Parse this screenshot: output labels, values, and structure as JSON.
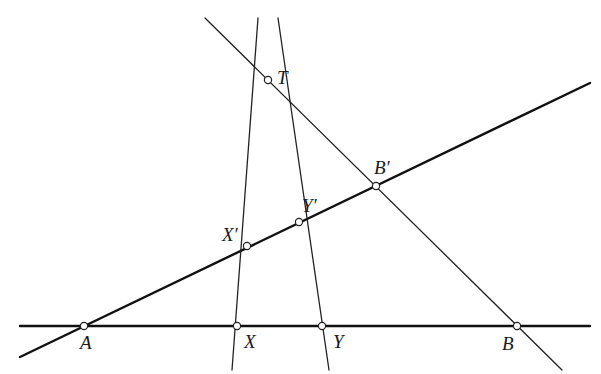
{
  "diagram": {
    "type": "projective-geometry-figure",
    "points": {
      "T": {
        "label": "T",
        "x": 268,
        "y": 80,
        "lx": 277,
        "ly": 84
      },
      "A": {
        "label": "A",
        "x": 84,
        "y": 326,
        "lx": 80,
        "ly": 349
      },
      "X": {
        "label": "X",
        "x": 237,
        "y": 326,
        "lx": 244,
        "ly": 348
      },
      "Y": {
        "label": "Y",
        "x": 322,
        "y": 326,
        "lx": 333,
        "ly": 348
      },
      "B": {
        "label": "B",
        "x": 517,
        "y": 326,
        "lx": 502,
        "ly": 350
      },
      "Xp": {
        "label": "X′",
        "x": 247,
        "y": 246,
        "lx": 222,
        "ly": 241
      },
      "Yp": {
        "label": "Y′",
        "x": 299,
        "y": 222,
        "lx": 302,
        "ly": 212
      },
      "Bp": {
        "label": "B′",
        "x": 376,
        "y": 186,
        "lx": 374,
        "ly": 174
      }
    },
    "lines": [
      {
        "name": "line-AB-horizontal",
        "weight": "thick",
        "x1": 20,
        "y1": 326,
        "x2": 590,
        "y2": 326
      },
      {
        "name": "line-AB-prime",
        "weight": "thick",
        "x1": 20,
        "y1": 357,
        "x2": 590,
        "y2": 83
      },
      {
        "name": "line-TB",
        "weight": "thin",
        "x1": 205,
        "y1": 18,
        "x2": 562,
        "y2": 370
      },
      {
        "name": "line-TX",
        "weight": "thin",
        "x1": 258,
        "y1": 18,
        "x2": 232,
        "y2": 370
      },
      {
        "name": "line-TY",
        "weight": "thin",
        "x1": 278,
        "y1": 18,
        "x2": 329,
        "y2": 370
      }
    ]
  }
}
